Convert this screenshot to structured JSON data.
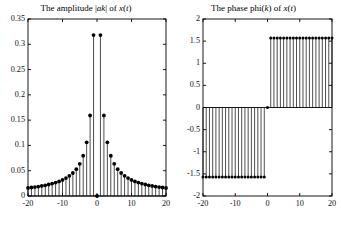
{
  "figure": {
    "background_color": "#ffffff",
    "line_color": "#000000",
    "marker_color": "#000000",
    "width": 335,
    "height": 227
  },
  "panels": [
    {
      "key": "amplitude",
      "title_prefix": "The amplitude |",
      "title_var": "ak",
      "title_mid": "| of ",
      "title_signal": "x",
      "title_suffix": "(",
      "title_signal_var": "t",
      "title_end": ")",
      "title_plain": "The amplitude |ak| of x(t)",
      "yticks": [
        "0",
        "0.05",
        "0.1",
        "0.15",
        "0.2",
        "0.25",
        "0.3",
        "0.35"
      ],
      "xticks": [
        "-20",
        "-10",
        "0",
        "10",
        "20"
      ]
    },
    {
      "key": "phase",
      "title_plain": "The phase phi(k) of x(t)",
      "title_prefix": "The phase phi(",
      "title_var": "k",
      "title_mid": ") of ",
      "title_signal": "x",
      "title_suffix": "(",
      "title_signal_var": "t",
      "title_end": ")",
      "yticks": [
        "-2",
        "-1.5",
        "-1",
        "-0.5",
        "0",
        "0.5",
        "1",
        "1.5",
        "2"
      ],
      "xticks": [
        "-20",
        "-10",
        "0",
        "10",
        "20"
      ]
    }
  ],
  "chart_data": [
    {
      "type": "scatter",
      "style": "stem",
      "title": "The amplitude |ak| of x(t)",
      "xlabel": "",
      "ylabel": "",
      "xlim": [
        -20,
        20
      ],
      "ylim": [
        0,
        0.35
      ],
      "grid": false,
      "legend": "none",
      "xticks": [
        -20,
        -10,
        0,
        10,
        20
      ],
      "yticks": [
        0,
        0.05,
        0.1,
        0.15,
        0.2,
        0.25,
        0.3,
        0.35
      ],
      "x": [
        -20,
        -19,
        -18,
        -17,
        -16,
        -15,
        -14,
        -13,
        -12,
        -11,
        -10,
        -9,
        -8,
        -7,
        -6,
        -5,
        -4,
        -3,
        -2,
        -1,
        0,
        1,
        2,
        3,
        4,
        5,
        6,
        7,
        8,
        9,
        10,
        11,
        12,
        13,
        14,
        15,
        16,
        17,
        18,
        19,
        20
      ],
      "values": [
        0.0159,
        0.0168,
        0.0177,
        0.0187,
        0.0199,
        0.0212,
        0.0227,
        0.0245,
        0.0265,
        0.0289,
        0.0318,
        0.0354,
        0.0398,
        0.0455,
        0.0531,
        0.0637,
        0.0796,
        0.1061,
        0.1592,
        0.3183,
        0.0,
        0.3183,
        0.1592,
        0.1061,
        0.0796,
        0.0637,
        0.0531,
        0.0455,
        0.0398,
        0.0354,
        0.0318,
        0.0289,
        0.0265,
        0.0245,
        0.0227,
        0.0212,
        0.0199,
        0.0187,
        0.0177,
        0.0168,
        0.0159
      ]
    },
    {
      "type": "scatter",
      "style": "stem",
      "title": "The phase phi(k) of x(t)",
      "xlabel": "",
      "ylabel": "",
      "xlim": [
        -20,
        20
      ],
      "ylim": [
        -2,
        2
      ],
      "grid": false,
      "legend": "none",
      "xticks": [
        -20,
        -10,
        0,
        10,
        20
      ],
      "yticks": [
        -2,
        -1.5,
        -1,
        -0.5,
        0,
        0.5,
        1,
        1.5,
        2
      ],
      "x": [
        -20,
        -19,
        -18,
        -17,
        -16,
        -15,
        -14,
        -13,
        -12,
        -11,
        -10,
        -9,
        -8,
        -7,
        -6,
        -5,
        -4,
        -3,
        -2,
        -1,
        0,
        1,
        2,
        3,
        4,
        5,
        6,
        7,
        8,
        9,
        10,
        11,
        12,
        13,
        14,
        15,
        16,
        17,
        18,
        19,
        20
      ],
      "values": [
        -1.5708,
        -1.5708,
        -1.5708,
        -1.5708,
        -1.5708,
        -1.5708,
        -1.5708,
        -1.5708,
        -1.5708,
        -1.5708,
        -1.5708,
        -1.5708,
        -1.5708,
        -1.5708,
        -1.5708,
        -1.5708,
        -1.5708,
        -1.5708,
        -1.5708,
        -1.5708,
        0.0,
        1.5708,
        1.5708,
        1.5708,
        1.5708,
        1.5708,
        1.5708,
        1.5708,
        1.5708,
        1.5708,
        1.5708,
        1.5708,
        1.5708,
        1.5708,
        1.5708,
        1.5708,
        1.5708,
        1.5708,
        1.5708,
        1.5708,
        1.5708
      ]
    }
  ]
}
